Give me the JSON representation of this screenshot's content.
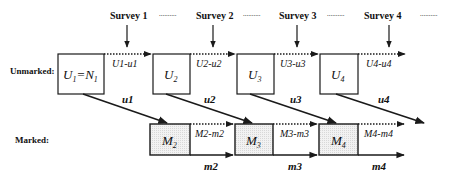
{
  "surveys": [
    {
      "label": "Survey 1",
      "x": 127
    },
    {
      "label": "Survey 2",
      "x": 213
    },
    {
      "label": "Survey 3",
      "x": 296
    },
    {
      "label": "Survey 4",
      "x": 380
    }
  ],
  "survey_gap_marker": "..........",
  "rows": {
    "unmarked_label": "Unmarked:",
    "marked_label": "Marked:"
  },
  "unmarked_boxes": [
    {
      "label": "U1=N1",
      "main": "U",
      "sub": "1",
      "eq": "=N",
      "eqsub": "1"
    },
    {
      "label": "U2",
      "main": "U",
      "sub": "2"
    },
    {
      "label": "U3",
      "main": "U",
      "sub": "3"
    },
    {
      "label": "U4",
      "main": "U",
      "sub": "4"
    }
  ],
  "unmarked_flows": [
    {
      "label": "U1-u1"
    },
    {
      "label": "U2-u2"
    },
    {
      "label": "U3-u3"
    },
    {
      "label": "U4-u4"
    }
  ],
  "marking_flows": [
    {
      "label": "u1"
    },
    {
      "label": "u2"
    },
    {
      "label": "u3"
    },
    {
      "label": "u4"
    }
  ],
  "marked_boxes": [
    {
      "label": "M2",
      "main": "M",
      "sub": "2"
    },
    {
      "label": "M3",
      "main": "M",
      "sub": "3"
    },
    {
      "label": "M4",
      "main": "M",
      "sub": "4"
    }
  ],
  "marked_flows": [
    {
      "label": "M2-m2"
    },
    {
      "label": "M3-m3"
    },
    {
      "label": "M4-m4"
    }
  ],
  "recapture_flows": [
    {
      "label": "m2"
    },
    {
      "label": "m3"
    },
    {
      "label": "m4"
    }
  ],
  "colors": {
    "line": "#1a1a1a",
    "marked_box_fill": "#ececec",
    "background": "#ffffff"
  }
}
